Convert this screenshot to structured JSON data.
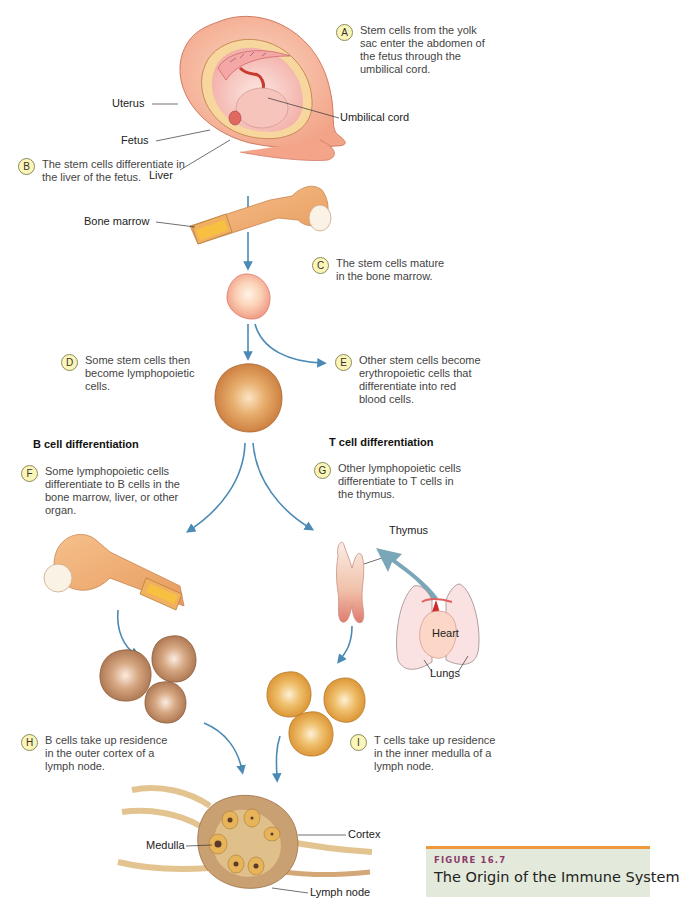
{
  "figure": {
    "number": "FIGURE 16.7",
    "title": "The Origin of the Immune System",
    "caption_accent_color": "#ec9a3c",
    "caption_bg_color": "#e4eadb",
    "figure_number_color": "#8a3a6a"
  },
  "colors": {
    "arrow": "#4a8ab5",
    "badge_fill": "#fbf6b8",
    "stem_cell": "#f6b9a0",
    "lymphopoietic_cell": "#d48a3e",
    "b_cell": "#b07d55",
    "t_cell": "#e7a33e"
  },
  "steps": [
    {
      "letter": "A",
      "text": "Stem cells from the yolk sac enter the abdomen of the fetus through the umbilical cord."
    },
    {
      "letter": "B",
      "text": "The stem cells differentiate in the liver of the fetus."
    },
    {
      "letter": "C",
      "text": "The stem cells mature in the bone marrow."
    },
    {
      "letter": "D",
      "text": "Some stem cells then become lymphopoietic cells."
    },
    {
      "letter": "E",
      "text": "Other stem cells become erythropoietic cells that differentiate into red blood cells."
    },
    {
      "letter": "F",
      "text": "Some lymphopoietic cells differentiate to B cells in the bone marrow, liver, or other organ."
    },
    {
      "letter": "G",
      "text": "Other lymphopoietic cells differentiate to T cells in the thymus."
    },
    {
      "letter": "H",
      "text": "B cells take up residence in the outer cortex of a lymph node."
    },
    {
      "letter": "I",
      "text": "T cells take up residence in the inner medulla of a lymph node."
    }
  ],
  "headings": {
    "b_cell": "B cell differentiation",
    "t_cell": "T cell differentiation"
  },
  "labels": {
    "uterus": "Uterus",
    "fetus": "Fetus",
    "liver": "Liver",
    "umbilical_cord": "Umbilical cord",
    "bone_marrow": "Bone marrow",
    "thymus": "Thymus",
    "heart": "Heart",
    "lungs": "Lungs",
    "cortex": "Cortex",
    "medulla": "Medulla",
    "lymph_node": "Lymph node"
  }
}
